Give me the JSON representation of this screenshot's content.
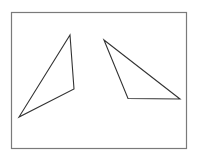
{
  "diagram": {
    "stroke_color": "#333333",
    "frame_color": "#7a7a7a",
    "shapes": [
      {
        "name": "left-triangle",
        "type": "triangle"
      },
      {
        "name": "right-triangle",
        "type": "triangle"
      }
    ]
  }
}
